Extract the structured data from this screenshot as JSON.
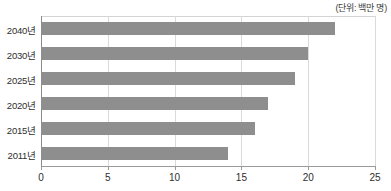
{
  "unit_note": "(단위: 백만 명)",
  "chart_data": {
    "type": "bar",
    "orientation": "horizontal",
    "title": "",
    "subtitle": "",
    "xlabel": "",
    "ylabel": "",
    "unit_note": "(단위: 백만 명)",
    "categories": [
      "2011년",
      "2015년",
      "2020년",
      "2025년",
      "2030년",
      "2040년"
    ],
    "values": [
      14,
      16,
      17,
      19,
      20,
      22
    ],
    "display_order_top_to_bottom": [
      "2040년",
      "2030년",
      "2025년",
      "2020년",
      "2015년",
      "2011년"
    ],
    "display_values_top_to_bottom": [
      22,
      20,
      19,
      17,
      16,
      14
    ],
    "xlim": [
      0,
      25
    ],
    "xticks": [
      0,
      5,
      10,
      15,
      20,
      25
    ],
    "xtick_labels": [
      "0",
      "5",
      "10",
      "15",
      "20",
      "25"
    ],
    "grid": true,
    "grid_axis": "x",
    "legend": false,
    "legend_position": "none",
    "bar_color": "#8e8e8e",
    "grid_color": "#dadada",
    "axis_color": "#9a9a9a",
    "background": "#ffffff"
  }
}
